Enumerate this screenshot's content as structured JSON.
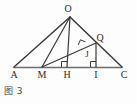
{
  "figure": {
    "caption": "图 3",
    "stroke_color": "#3b3b3b",
    "baseline_color": "#6d6d6d",
    "label_color": "#2a2a2a",
    "background": "#fdfdfd",
    "points": [
      {
        "name": "O",
        "label": "O",
        "x": 70,
        "y": 17,
        "label_x": 68,
        "label_y": 11
      },
      {
        "name": "A",
        "label": "A",
        "x": 14,
        "y": 67,
        "label_x": 14,
        "label_y": 76
      },
      {
        "name": "M",
        "label": "M",
        "x": 42,
        "y": 67,
        "label_x": 42,
        "label_y": 76
      },
      {
        "name": "H",
        "label": "H",
        "x": 67,
        "y": 67,
        "label_x": 67,
        "label_y": 76
      },
      {
        "name": "I",
        "label": "I",
        "x": 96,
        "y": 67,
        "label_x": 96,
        "label_y": 76
      },
      {
        "name": "C",
        "label": "C",
        "x": 122,
        "y": 67,
        "label_x": 123,
        "label_y": 76
      },
      {
        "name": "Q",
        "label": "Q",
        "x": 96,
        "y": 43,
        "label_x": 99,
        "label_y": 38
      },
      {
        "name": "J",
        "label": "J",
        "x": 84,
        "y": 48,
        "label_x": 87,
        "label_y": 55
      }
    ],
    "segments": [
      {
        "name": "baseline-AC",
        "from": "A",
        "to": "C"
      },
      {
        "name": "side-OA",
        "from": "O",
        "to": "A"
      },
      {
        "name": "side-OC",
        "from": "O",
        "to": "C"
      },
      {
        "name": "cevian-OM",
        "from": "O",
        "to": "M"
      },
      {
        "name": "altitude-OH",
        "from": "O",
        "to": "H"
      },
      {
        "name": "segment-MQ",
        "from": "M",
        "to": "Q"
      },
      {
        "name": "altitude-QI",
        "from": "Q",
        "to": "I"
      }
    ],
    "right_angle_marks": [
      {
        "name": "right-angle-at-H",
        "x": 67,
        "y": 67,
        "size": 6,
        "dir_x": -1,
        "dir_y": -1,
        "rotation": 0
      },
      {
        "name": "right-angle-at-I",
        "x": 96,
        "y": 67,
        "size": 6,
        "dir_x": -1,
        "dir_y": -1,
        "rotation": 0
      },
      {
        "name": "right-angle-at-J",
        "x": 84,
        "y": 48,
        "size": 6,
        "dir_x": -1,
        "dir_y": -1,
        "rotation": 22
      }
    ]
  }
}
